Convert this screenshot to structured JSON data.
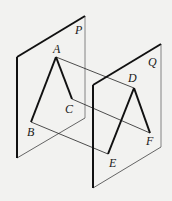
{
  "diagram": {
    "type": "geometry-parallel-planes",
    "planes": [
      {
        "label": "P",
        "corners": {
          "top_left": [
            17,
            57
          ],
          "top_right": [
            85,
            16
          ],
          "bottom_right": [
            85,
            118
          ],
          "bottom_left": [
            17,
            158
          ]
        },
        "label_pos": [
          76,
          34
        ]
      },
      {
        "label": "Q",
        "corners": {
          "top_left": [
            93,
            85
          ],
          "top_right": [
            161,
            44
          ],
          "bottom_right": [
            161,
            147
          ],
          "bottom_left": [
            93,
            188
          ]
        },
        "label_pos": [
          149,
          66
        ]
      }
    ],
    "points": {
      "A": {
        "pos": [
          56,
          57
        ],
        "label_pos": [
          54,
          53
        ]
      },
      "B": {
        "pos": [
          31,
          122
        ],
        "label_pos": [
          28,
          135
        ]
      },
      "C": {
        "pos": [
          72,
          99
        ],
        "label_pos": [
          65,
          112
        ]
      },
      "D": {
        "pos": [
          134,
          88
        ],
        "label_pos": [
          129,
          81
        ]
      },
      "E": {
        "pos": [
          108,
          154
        ],
        "label_pos": [
          110,
          167
        ]
      },
      "F": {
        "pos": [
          150,
          133
        ],
        "label_pos": [
          147,
          144
        ]
      }
    },
    "thick_segments": [
      [
        "A",
        "B"
      ],
      [
        "A",
        "C"
      ],
      [
        "D",
        "E"
      ],
      [
        "D",
        "F"
      ]
    ],
    "thin_segments": [
      [
        "A",
        "D"
      ],
      [
        "B",
        "E"
      ],
      [
        "C",
        "F"
      ]
    ],
    "colors": {
      "line": "#111111",
      "thin_edge": "#777777",
      "background": "#f2f2f0"
    }
  },
  "labels": {
    "P": "P",
    "Q": "Q",
    "A": "A",
    "B": "B",
    "C": "C",
    "D": "D",
    "E": "E",
    "F": "F"
  }
}
